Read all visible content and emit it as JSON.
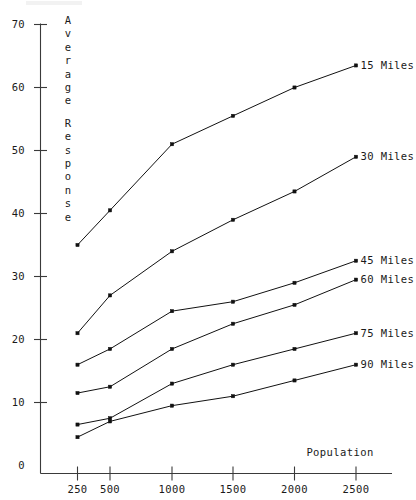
{
  "chart_data": {
    "type": "line",
    "title": "",
    "xlabel": "Population",
    "ylabel": "Average Response",
    "x": [
      250,
      500,
      1000,
      1500,
      2000,
      2500
    ],
    "categories": [
      "250",
      "500",
      "1000",
      "1500",
      "2000",
      "2500"
    ],
    "xtick_labels": [
      "250",
      "500",
      "1000",
      "1500",
      "2000",
      "2500"
    ],
    "ytick_labels": [
      "0",
      "10",
      "20",
      "30",
      "40",
      "50",
      "60",
      "70"
    ],
    "ytick_values": [
      0,
      10,
      20,
      30,
      40,
      50,
      60,
      70
    ],
    "ylim": [
      0,
      70
    ],
    "grid": false,
    "legend_position": "right-inline",
    "marker": "filled-square",
    "series": [
      {
        "name": "15 Miles",
        "label": "15 Miles",
        "values": [
          35,
          40.5,
          51,
          55.5,
          60,
          63.5
        ]
      },
      {
        "name": "30 Miles",
        "label": "30 Miles",
        "values": [
          21,
          27,
          34,
          39,
          43.5,
          49
        ]
      },
      {
        "name": "45 Miles",
        "label": "45 Miles",
        "values": [
          16,
          18.5,
          24.5,
          26,
          29,
          32.5
        ]
      },
      {
        "name": "60 Miles",
        "label": "60 Miles",
        "values": [
          11.5,
          12.5,
          18.5,
          22.5,
          25.5,
          29.5
        ]
      },
      {
        "name": "75 Miles",
        "label": "75 Miles",
        "values": [
          6.5,
          7.5,
          13,
          16,
          18.5,
          21
        ]
      },
      {
        "name": "90 Miles",
        "label": "90 Miles",
        "values": [
          4.5,
          7,
          9.5,
          11,
          13.5,
          16
        ]
      }
    ]
  },
  "ylabel_chars": [
    "A",
    "v",
    "e",
    "r",
    "a",
    "g",
    "e",
    "",
    "R",
    "e",
    "s",
    "p",
    "o",
    "n",
    "s",
    "e"
  ],
  "colors": {
    "ink": "#111111",
    "axis": "#3a3a3a",
    "background": "#ffffff"
  }
}
